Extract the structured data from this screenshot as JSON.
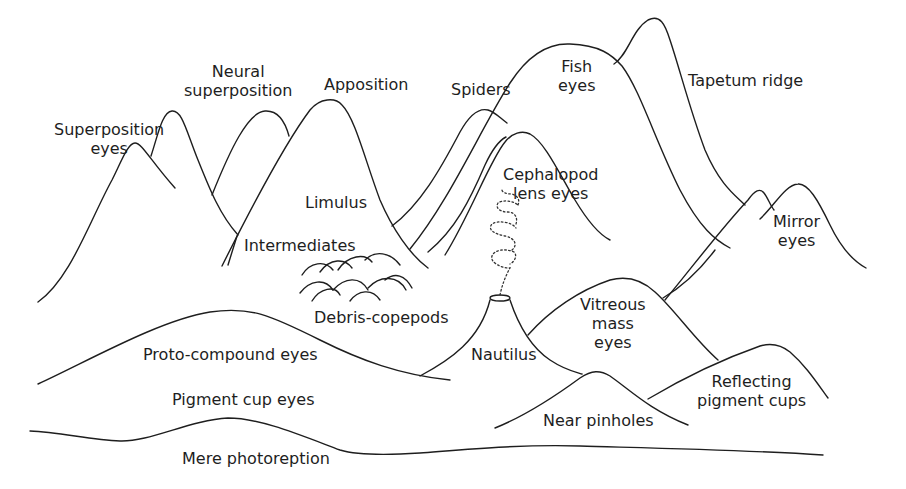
{
  "diagram": {
    "stroke_color": "#1e1e1e",
    "background": "#ffffff",
    "labels": {
      "superposition": [
        "Superposition",
        "eyes"
      ],
      "neural_superposition": [
        "Neural",
        "superposition"
      ],
      "apposition": [
        "Apposition"
      ],
      "spiders": [
        "Spiders"
      ],
      "fish": [
        "Fish",
        "eyes"
      ],
      "tapetum": [
        "Tapetum ridge"
      ],
      "limulus": [
        "Limulus"
      ],
      "cephalopod": [
        "Cephalopod",
        "lens eyes"
      ],
      "mirror": [
        "Mirror",
        "eyes"
      ],
      "intermediates": [
        "Intermediates"
      ],
      "debris": [
        "Debris-copepods"
      ],
      "vitreous": [
        "Vitreous",
        "mass",
        "eyes"
      ],
      "proto_compound": [
        "Proto-compound eyes"
      ],
      "nautilus": [
        "Nautilus"
      ],
      "reflecting": [
        "Reflecting",
        "pigment cups"
      ],
      "pigment_cup": [
        "Pigment cup eyes"
      ],
      "near_pinholes": [
        "Near pinholes"
      ],
      "mere": [
        "Mere photoreption"
      ]
    }
  }
}
